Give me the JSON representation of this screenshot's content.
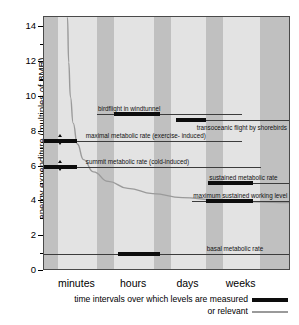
{
  "chart_data": {
    "type": "bar",
    "title": "",
    "xlabel": "",
    "ylabel": "energy expenditure (multiples of BMR)",
    "ylim": [
      0,
      14.6
    ],
    "yticks": [
      0,
      2,
      4,
      6,
      8,
      10,
      12,
      14
    ],
    "ytick_labels": [
      "0",
      "2",
      "4",
      "6",
      "8",
      "10",
      "12",
      "14"
    ],
    "yminor_ticks": [
      1,
      3,
      5,
      7,
      9,
      11,
      13
    ],
    "grid": false,
    "xcategories": [
      "minutes",
      "hours",
      "days",
      "weeks"
    ],
    "legend_position": "below-right",
    "bars": [
      {
        "label": "birdflight in windtunnel",
        "value": 9.0,
        "x_start_frac": 0.285,
        "x_end_frac": 0.47,
        "line_start_frac": 0.215,
        "line_end_frac": 0.8,
        "label_x_frac": 0.215,
        "label_above": true
      },
      {
        "label": "transoceanic flight by shorebirds",
        "value": 8.7,
        "x_start_frac": 0.535,
        "x_end_frac": 0.655,
        "line_start_frac": 0.535,
        "line_end_frac": 1.0,
        "label_x_frac": 1.0,
        "label_above": false
      },
      {
        "label": "maximal metabolic rate (exercise- induced)",
        "value": 7.5,
        "x_start_frac": 0.0,
        "x_end_frac": 0.135,
        "line_start_frac": 0.0,
        "line_end_frac": 0.8,
        "label_x_frac": 0.165,
        "label_above": true,
        "arrows": {
          "x_frac": 0.068,
          "up": 7.9,
          "down": 7.2
        }
      },
      {
        "label": "summit metabolic rate (cold-induced)",
        "value": 6.0,
        "x_start_frac": 0.0,
        "x_end_frac": 0.135,
        "line_start_frac": 0.0,
        "line_end_frac": 0.88,
        "label_x_frac": 0.165,
        "label_above": true,
        "arrows": {
          "x_frac": 0.068,
          "up": 6.4,
          "down": 5.7
        }
      },
      {
        "label": "sustained metabolic rate",
        "value": 5.05,
        "x_start_frac": 0.665,
        "x_end_frac": 0.845,
        "line_start_frac": 0.665,
        "line_end_frac": 1.0,
        "label_x_frac": 0.665,
        "label_above": true
      },
      {
        "label": "maximum sustained working level",
        "value": 4.05,
        "x_start_frac": 0.655,
        "x_end_frac": 0.845,
        "line_start_frac": 0.6,
        "line_end_frac": 1.0,
        "label_x_frac": 0.6,
        "label_above": true
      },
      {
        "label": "basal metabolic rate",
        "value": 1.0,
        "x_start_frac": 0.3,
        "x_end_frac": 0.47,
        "line_start_frac": 0.0,
        "line_end_frac": 1.0,
        "label_x_frac": 0.655,
        "label_above": true
      }
    ],
    "curve": {
      "description": "decaying hyperbolic curve from top-left to lower-right",
      "color": "#9a9a9a",
      "points": [
        [
          0.095,
          14.6
        ],
        [
          0.1,
          12.0
        ],
        [
          0.107,
          10.0
        ],
        [
          0.118,
          8.5
        ],
        [
          0.135,
          7.3
        ],
        [
          0.16,
          6.4
        ],
        [
          0.2,
          5.7
        ],
        [
          0.26,
          5.15
        ],
        [
          0.34,
          4.75
        ],
        [
          0.44,
          4.45
        ],
        [
          0.56,
          4.22
        ],
        [
          0.7,
          4.08
        ],
        [
          0.85,
          3.98
        ],
        [
          1.0,
          3.93
        ]
      ]
    },
    "background_bands": [
      {
        "start_frac": 0.0,
        "end_frac": 0.055,
        "color": "#c0c0c0"
      },
      {
        "start_frac": 0.055,
        "end_frac": 0.215,
        "color": "#e3e3e3"
      },
      {
        "start_frac": 0.215,
        "end_frac": 0.285,
        "color": "#c0c0c0"
      },
      {
        "start_frac": 0.285,
        "end_frac": 0.445,
        "color": "#e3e3e3"
      },
      {
        "start_frac": 0.445,
        "end_frac": 0.515,
        "color": "#c0c0c0"
      },
      {
        "start_frac": 0.515,
        "end_frac": 0.655,
        "color": "#e3e3e3"
      },
      {
        "start_frac": 0.655,
        "end_frac": 0.725,
        "color": "#c0c0c0"
      },
      {
        "start_frac": 0.725,
        "end_frac": 0.875,
        "color": "#e3e3e3"
      },
      {
        "start_frac": 0.875,
        "end_frac": 1.0,
        "color": "#c0c0c0"
      }
    ],
    "xcategory_positions": [
      0.135,
      0.365,
      0.585,
      0.8
    ]
  },
  "legend": {
    "measured_label": "time intervals over which levels are measured",
    "relevant_label": "or relevant"
  },
  "colors": {
    "bar": "#0d0d0d",
    "rule": "#3c3c3c",
    "curve": "#9a9a9a",
    "band_light": "#e3e3e3",
    "band_dark": "#c0c0c0",
    "frame": "#4a4a4a"
  }
}
